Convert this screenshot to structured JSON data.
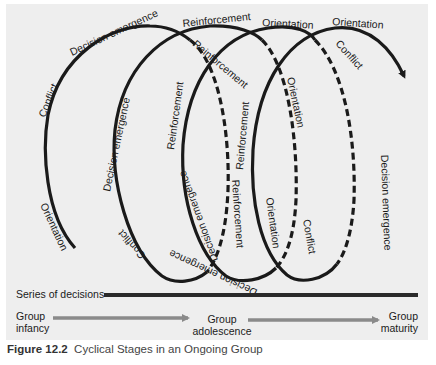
{
  "figure": {
    "number": "Figure 12.2",
    "title": "Cyclical Stages in an Ongoing Group"
  },
  "spiral": {
    "loops": [
      {
        "front_labels": [
          "Orientation",
          "Conflict",
          "Decision emergence"
        ],
        "back_labels": [
          "Reinforcement"
        ]
      },
      {
        "front_labels": [
          "Conflict",
          "Decision emergence",
          "Reinforcement"
        ],
        "back_labels": [
          "Reinforcement",
          "Orientation"
        ]
      },
      {
        "front_labels": [
          "Decision emergence",
          "Reinforcement",
          "Orientation"
        ],
        "back_labels": [
          "Orientation",
          "Conflict"
        ]
      },
      {
        "front_labels": [
          "Orientation"
        ],
        "back_labels": [
          "Conflict",
          "Decision emergence"
        ]
      }
    ],
    "labels": {
      "l1_orientation": "Orientation",
      "l1_conflict": "Conflict",
      "l1_decision": "Decision emergence",
      "top_reinforcement": "Reinforcement",
      "top_orientation_1": "Orientation",
      "top_orientation_2": "Orientation",
      "back_reinforcement": "Reinforcement",
      "l2_decision": "Decision emergence",
      "l2_reinforcement": "Reinforcement",
      "l3_reinforcement": "Reinforcement",
      "back_orientation_1": "Orientation",
      "back_orientation_2": "Orientation",
      "back_conflict_1": "Conflict",
      "back_conflict_2": "Conflict",
      "l2_conflict": "Conflict",
      "l2_bottom_decision": "Decision emergence",
      "l3_bottom_decision": "Decision emergence",
      "back_decision": "Decision emergence"
    }
  },
  "timeline": {
    "series_label": "Series of decisions",
    "stages": [
      {
        "line1": "Group",
        "line2": "infancy"
      },
      {
        "line1": "Group",
        "line2": "adolescence"
      },
      {
        "line1": "Group",
        "line2": "maturity"
      }
    ]
  },
  "colors": {
    "panel_bg": "#eeeeee",
    "curve": "#1a1a1a",
    "stage_arrow": "#8a8a8a",
    "series_bar": "#2a2a2a"
  }
}
